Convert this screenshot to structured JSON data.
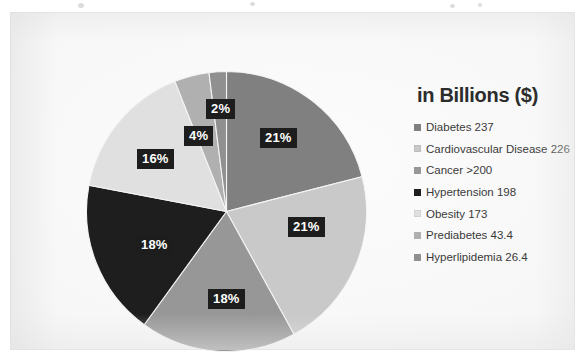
{
  "slide": {
    "background_color": "#f7f7f7",
    "surface_color": "#fbfbfb"
  },
  "legend": {
    "title": "in Billions ($)",
    "items": [
      {
        "label": "Diabetes 237",
        "color": "#808080"
      },
      {
        "label": "Cardiovascular Disease 226",
        "color": "#c9c9c9"
      },
      {
        "label": "Cancer >200",
        "color": "#979797"
      },
      {
        "label": "Hypertension 198",
        "color": "#1e1e1e"
      },
      {
        "label": "Obesity 173",
        "color": "#e0e0e0"
      },
      {
        "label": "Prediabetes 43.4",
        "color": "#b0b0b0"
      },
      {
        "label": "Hyperlipidemia 26.4",
        "color": "#909090"
      }
    ]
  },
  "labels": {
    "slice_1": "21%",
    "slice_2": "21%",
    "slice_3": "18%",
    "slice_4": "18%",
    "slice_5": "16%",
    "slice_6": "4%",
    "slice_7": "2%"
  },
  "chart_data": {
    "type": "pie",
    "title": "in Billions ($)",
    "unit": "Billions ($)",
    "categories": [
      "Diabetes",
      "Cardiovascular Disease",
      "Cancer",
      "Hypertension",
      "Obesity",
      "Prediabetes",
      "Hyperlipidemia"
    ],
    "values": [
      237,
      226,
      200,
      198,
      173,
      43.4,
      26.4
    ],
    "value_labels": [
      "237",
      "226",
      ">200",
      "198",
      "173",
      "43.4",
      "26.4"
    ],
    "percentages": [
      21,
      21,
      18,
      18,
      16,
      4,
      2
    ],
    "data_labels": [
      "21%",
      "21%",
      "18%",
      "18%",
      "16%",
      "4%",
      "2%"
    ],
    "colors": [
      "#808080",
      "#c9c9c9",
      "#979797",
      "#1e1e1e",
      "#e0e0e0",
      "#b0b0b0",
      "#909090"
    ],
    "legend_position": "right",
    "start_angle_deg": 0,
    "direction": "clockwise",
    "grid": false
  }
}
